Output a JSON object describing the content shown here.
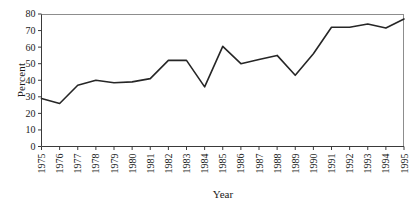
{
  "chart_data": {
    "type": "line",
    "title": "",
    "xlabel": "Year",
    "ylabel": "Percent",
    "categories": [
      "1975",
      "1976",
      "1977",
      "1978",
      "1979",
      "1980",
      "1981",
      "1982",
      "1983",
      "1984",
      "1985",
      "1986",
      "1987",
      "1988",
      "1989",
      "1990",
      "1991",
      "1992",
      "1993",
      "1994",
      "1995"
    ],
    "x": [
      1975,
      1976,
      1977,
      1978,
      1979,
      1980,
      1981,
      1982,
      1983,
      1984,
      1985,
      1986,
      1987,
      1988,
      1989,
      1990,
      1991,
      1992,
      1993,
      1994,
      1995
    ],
    "values": [
      29,
      26,
      37,
      40,
      38.5,
      39,
      41,
      52,
      52,
      36,
      60.5,
      50,
      52.5,
      55,
      43,
      56,
      72,
      72,
      74,
      71.5,
      77
    ],
    "series": [
      {
        "name": "Percent",
        "values": [
          29,
          26,
          37,
          40,
          38.5,
          39,
          41,
          52,
          52,
          36,
          60.5,
          50,
          52.5,
          55,
          43,
          56,
          72,
          72,
          74,
          71.5,
          77
        ]
      }
    ],
    "ylim": [
      0,
      80
    ],
    "xlim": [
      1975,
      1995
    ],
    "yticks": [
      0,
      10,
      20,
      30,
      40,
      50,
      60,
      70,
      80
    ],
    "ytick_labels": [
      "0",
      "10",
      "20",
      "30",
      "40",
      "50",
      "60",
      "70",
      "80"
    ],
    "xtick_labels": [
      "1975",
      "1976",
      "1977",
      "1978",
      "1979",
      "1980",
      "1981",
      "1982",
      "1983",
      "1984",
      "1985",
      "1986",
      "1987",
      "1988",
      "1989",
      "1990",
      "1991",
      "1992",
      "1993",
      "1994",
      "1995"
    ],
    "grid": false,
    "legend": null,
    "legend_position": "none",
    "line_color": "#262626",
    "axis_color": "#3a3a3a",
    "background_color": "#ffffff",
    "xtick_rotation": -90
  },
  "axes": {
    "y_title": "Percent",
    "x_title": "Year"
  }
}
